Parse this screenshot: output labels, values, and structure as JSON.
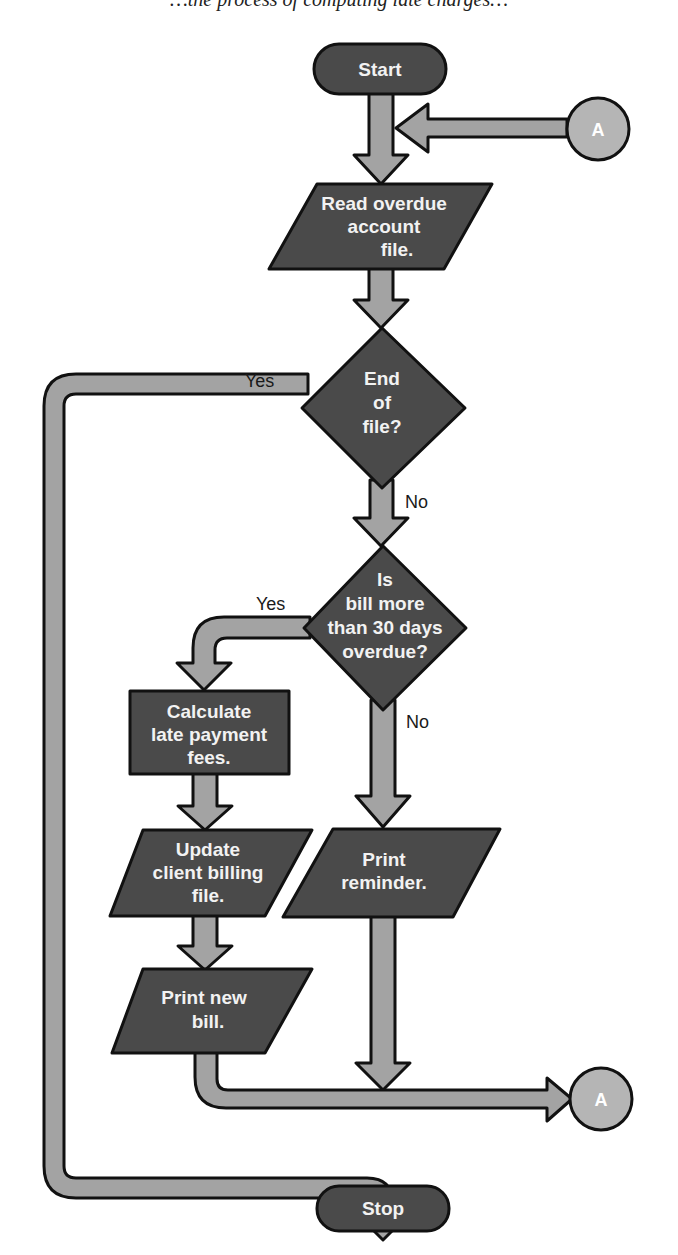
{
  "caption_cropped": "…the process of computing late charges…",
  "colors": {
    "node_fill": "#4a4a4a",
    "pipe_fill": "#a3a3a3",
    "connector_fill": "#b5b5b5",
    "outline": "#111111",
    "node_text": "#f2f2f2"
  },
  "nodes": {
    "start": {
      "label": "Start"
    },
    "read_file": {
      "lines": [
        "Read overdue",
        "account",
        "file."
      ]
    },
    "end_of_file": {
      "lines": [
        "End",
        "of",
        "file?"
      ],
      "yes": "Yes",
      "no": "No"
    },
    "overdue_check": {
      "lines": [
        "Is",
        "bill more",
        "than 30 days",
        "overdue?"
      ],
      "yes": "Yes",
      "no": "No"
    },
    "calc_fees": {
      "lines": [
        "Calculate",
        "late payment",
        "fees."
      ]
    },
    "update_billing": {
      "lines": [
        "Update",
        "client billing",
        "file."
      ]
    },
    "print_reminder": {
      "lines": [
        "Print",
        "reminder."
      ]
    },
    "print_bill": {
      "lines": [
        "Print new",
        "bill."
      ]
    },
    "stop": {
      "label": "Stop"
    },
    "connector_top": {
      "label": "A"
    },
    "connector_bottom": {
      "label": "A"
    }
  }
}
